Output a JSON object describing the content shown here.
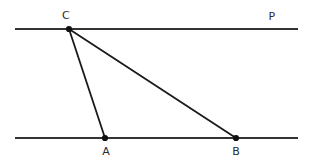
{
  "figure": {
    "name": "triangle-between-parallel-lines",
    "width": 314,
    "height": 162,
    "background_color": "#ffffff"
  },
  "colors": {
    "parallel_line": "#333333",
    "triangle_side": "#1a1a1a",
    "vertex_dot": "#111111",
    "label_text": "#2b2b2b"
  },
  "lines": [
    {
      "id": "top-line",
      "label": "P",
      "label_x": 272,
      "label_y": 20,
      "x1": 15,
      "y1": 29,
      "x2": 298,
      "y2": 29
    },
    {
      "id": "bottom-line",
      "label": "",
      "x1": 15,
      "y1": 138,
      "x2": 298,
      "y2": 138
    }
  ],
  "points": [
    {
      "id": "point-c",
      "label": "C",
      "x": 69,
      "y": 29,
      "label_x": 66,
      "label_y": 19,
      "label_anchor": "middle"
    },
    {
      "id": "point-a",
      "label": "A",
      "x": 105,
      "y": 138,
      "label_x": 106,
      "label_y": 155,
      "label_anchor": "middle"
    },
    {
      "id": "point-b",
      "label": "B",
      "x": 236,
      "y": 138,
      "label_x": 236,
      "label_y": 155,
      "label_anchor": "middle"
    }
  ],
  "segments": [
    {
      "id": "segment-ca",
      "from": "C",
      "to": "A",
      "x1": 69,
      "y1": 29,
      "x2": 105,
      "y2": 138
    },
    {
      "id": "segment-cb",
      "from": "C",
      "to": "B",
      "x1": 69,
      "y1": 29,
      "x2": 236,
      "y2": 138
    }
  ]
}
